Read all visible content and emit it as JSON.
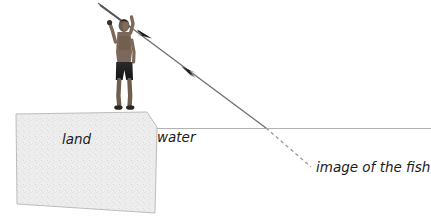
{
  "figure": {
    "type": "physics-optics-refraction-diagram",
    "background_color": "#ffffff"
  },
  "labels": {
    "land": "land",
    "water": "water",
    "image_of_the_fish": "image of the fish"
  },
  "colors": {
    "land_fill": "#ececec",
    "land_stroke": "#b9b9b9",
    "water_line": "#b0b0b0",
    "ray_line": "#6e6e6e",
    "dashed_line": "#9a9a9a",
    "text": "#1a1a1a",
    "figure_dark": "#1d1d1d",
    "skin": "#8e7a68"
  },
  "geometry": {
    "land_polygon": "16,114 147,112 157,127 155,213 17,204",
    "water_line": {
      "x1": 157,
      "y1": 128,
      "x2": 431,
      "y2": 128
    },
    "solid_ray": {
      "x1": 98,
      "y1": 3,
      "x2": 266,
      "y2": 128
    },
    "dashed_ray": {
      "x1": 266,
      "y1": 128,
      "x2": 311,
      "y2": 167
    },
    "arrowhead_down_right_at": {
      "x": 148,
      "y": 35
    },
    "arrowhead_up_left_at": {
      "x": 188,
      "y": 71
    }
  },
  "annotations": {
    "arrow_outgoing_direction": "down-right",
    "arrow_incoming_direction": "up-left",
    "person": "man standing on land holding a spear overhead",
    "spear_tip_exits_frame": "top-left"
  }
}
